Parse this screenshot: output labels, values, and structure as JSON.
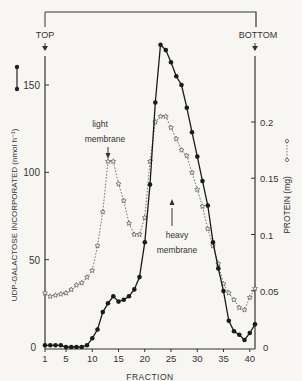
{
  "chart_data": {
    "type": "line",
    "title": "",
    "xlabel": "FRACTION",
    "ylabel": "UDP-GALACTOSE INCORPORATED (nmol h⁻¹)",
    "y2label": "PROTEIN (mg)",
    "xlim": [
      1,
      41
    ],
    "ylim": [
      0,
      175
    ],
    "y2lim": [
      0,
      0.25
    ],
    "x_ticks": [
      1,
      5,
      10,
      15,
      20,
      25,
      30,
      35,
      40
    ],
    "y_ticks": [
      0,
      50,
      100,
      150
    ],
    "y2_ticks": [
      "0",
      "0.05",
      "0.1",
      "0.15",
      "0.2"
    ],
    "y2_tick_values": [
      0,
      0.05,
      0.1,
      0.15,
      0.2
    ],
    "grid": false,
    "x": [
      1,
      2,
      3,
      4,
      5,
      6,
      7,
      8,
      9,
      10,
      11,
      12,
      13,
      14,
      15,
      16,
      17,
      18,
      19,
      20,
      21,
      22,
      23,
      24,
      25,
      26,
      27,
      28,
      29,
      30,
      31,
      32,
      33,
      34,
      35,
      36,
      37,
      38,
      39,
      40,
      41
    ],
    "series": [
      {
        "name": "UDP-galactose incorporated",
        "axis": "left",
        "style": "solid, filled circles",
        "values": [
          1,
          1,
          1,
          1,
          0,
          0,
          0,
          0,
          1,
          5,
          10,
          20,
          25,
          29,
          26,
          27,
          29,
          33,
          40,
          60,
          93,
          140,
          173,
          170,
          163,
          155,
          150,
          137,
          123,
          109,
          95,
          81,
          60,
          45,
          32,
          15,
          9,
          7,
          4,
          8,
          13
        ]
      },
      {
        "name": "Protein",
        "axis": "right",
        "style": "dotted, open stars",
        "values": [
          0.048,
          0.045,
          0.046,
          0.047,
          0.048,
          0.051,
          0.055,
          0.057,
          0.062,
          0.068,
          0.09,
          0.12,
          0.165,
          0.165,
          0.145,
          0.13,
          0.11,
          0.1,
          0.1,
          0.115,
          0.165,
          0.2,
          0.205,
          0.205,
          0.195,
          0.185,
          0.175,
          0.17,
          0.155,
          0.14,
          0.125,
          0.105,
          0.09,
          0.074,
          0.056,
          0.048,
          0.042,
          0.035,
          0.033,
          0.044,
          0.052
        ]
      }
    ],
    "annotations": [
      {
        "text": "TOP",
        "x": 1,
        "arrow": "down"
      },
      {
        "text": "BOTTOM",
        "x": 41,
        "arrow": "down"
      },
      {
        "text": "light membrane",
        "x": 14,
        "arrow": "down"
      },
      {
        "text": "heavy membrane",
        "x": 27,
        "arrow": "up"
      }
    ]
  },
  "labels": {
    "top": "TOP",
    "bottom": "BOTTOM",
    "light_1": "light",
    "light_2": "membrane",
    "heavy_1": "heavy",
    "heavy_2": "membrane",
    "xlabel": "FRACTION",
    "ylabel": "UDP-GALACTOSE INCORPORATED (nmol h⁻¹)",
    "y2label": "PROTEIN  (mg)"
  }
}
